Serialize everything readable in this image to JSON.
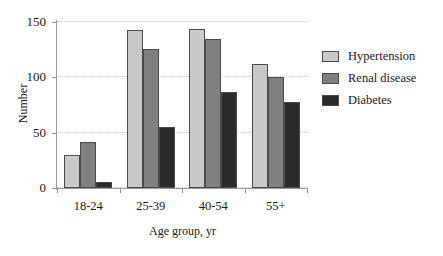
{
  "chart_data": {
    "type": "bar",
    "title": "",
    "xlabel": "Age group, yr",
    "ylabel": "Number",
    "categories": [
      "18-24",
      "25-39",
      "40-54",
      "55+"
    ],
    "series": [
      {
        "name": "Hypertension",
        "color": "#c9c9c9",
        "values": [
          30,
          143,
          144,
          112
        ]
      },
      {
        "name": "Renal disease",
        "color": "#808080",
        "values": [
          42,
          126,
          135,
          100
        ]
      },
      {
        "name": "Diabetes",
        "color": "#2a2a2a",
        "values": [
          5,
          55,
          87,
          78
        ]
      }
    ],
    "ylim": [
      0,
      150
    ],
    "yticks": [
      0,
      50,
      100,
      150
    ],
    "ytick_labels": [
      "0",
      "50",
      "100",
      "150"
    ],
    "grid": true,
    "legend_position": "right"
  }
}
